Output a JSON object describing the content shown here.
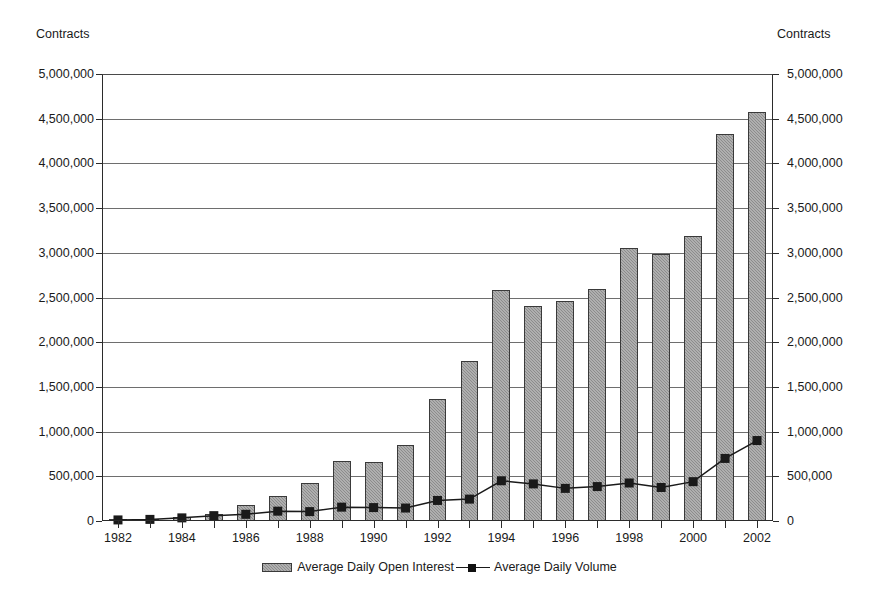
{
  "title_fragment": "",
  "axis_caption_left": "Contracts",
  "axis_caption_right": "Contracts",
  "y_axis": {
    "min": 0,
    "max": 5000000,
    "step": 500000,
    "tick_labels": [
      "5,000,000",
      "4,500,000",
      "4,000,000",
      "3,500,000",
      "3,000,000",
      "2,500,000",
      "2,000,000",
      "1,500,000",
      "1,000,000",
      "500,000",
      "0"
    ]
  },
  "x_axis": {
    "visible_labels": [
      "1982",
      "1984",
      "1986",
      "1988",
      "1990",
      "1992",
      "1994",
      "1996",
      "1998",
      "2000",
      "2002"
    ]
  },
  "legend": {
    "items": [
      {
        "label": "Average Daily Open Interest",
        "marker": "bar-swatch",
        "color": "#8c8c8c"
      },
      {
        "label": "Average Daily Volume",
        "marker": "line-square-marker",
        "color": "#1a1a1a"
      }
    ]
  },
  "colors": {
    "bar_fill": "#8c8c8c",
    "bar_outline": "#3a3a3a",
    "line": "#1a1a1a",
    "gridline": "#6e6e6e",
    "axis": "#2b2b2b",
    "background": "#ffffff"
  },
  "chart_data": {
    "type": "bar",
    "title": "",
    "xlabel": "",
    "ylabel": "Contracts",
    "ylim": [
      0,
      5000000
    ],
    "ytick_step": 500000,
    "grid": true,
    "legend_position": "bottom-center",
    "dual_axis": true,
    "categories": [
      "1982",
      "1983",
      "1984",
      "1985",
      "1986",
      "1987",
      "1988",
      "1989",
      "1990",
      "1991",
      "1992",
      "1993",
      "1994",
      "1995",
      "1996",
      "1997",
      "1998",
      "1999",
      "2000",
      "2001",
      "2002"
    ],
    "series": [
      {
        "name": "Average Daily Open Interest",
        "type": "bar",
        "values": [
          20000,
          25000,
          45000,
          75000,
          180000,
          285000,
          425000,
          670000,
          665000,
          845000,
          1370000,
          1790000,
          2580000,
          2400000,
          2465000,
          2600000,
          3050000,
          2985000,
          3190000,
          4330000,
          4570000
        ]
      },
      {
        "name": "Average Daily Volume",
        "type": "line",
        "marker": "square",
        "values": [
          12000,
          18000,
          35000,
          60000,
          75000,
          110000,
          105000,
          155000,
          150000,
          145000,
          230000,
          245000,
          450000,
          415000,
          365000,
          385000,
          425000,
          375000,
          440000,
          700000,
          900000
        ]
      }
    ]
  }
}
